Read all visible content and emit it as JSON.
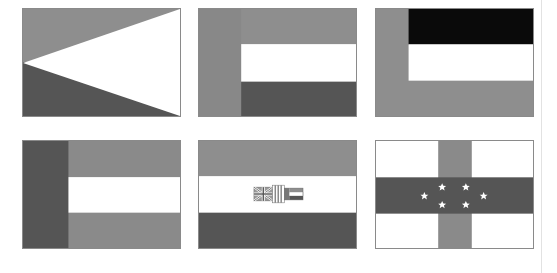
{
  "colors": {
    "light_gray": "#8e8e8e",
    "mid_gray": "#7f7f7f",
    "dark_gray": "#555555",
    "black": "#0a0a0a",
    "white": "#ffffff",
    "border": "#8a8a8a"
  },
  "flags": [
    {
      "id": "flag-1",
      "description": "Horizontal bicolor with white triangle from fly",
      "x": 22,
      "y": 8
    },
    {
      "id": "flag-2",
      "description": "Vertical hoist band with three horizontal stripes",
      "x": 198,
      "y": 8
    },
    {
      "id": "flag-3",
      "description": "L-shaped frame with black and white stripes",
      "x": 375,
      "y": 8
    },
    {
      "id": "flag-4",
      "description": "Dark hoist band with gray-white-gray stripes",
      "x": 22,
      "y": 140
    },
    {
      "id": "flag-5",
      "description": "Tricolor with central emblem of three small flags",
      "x": 198,
      "y": 140
    },
    {
      "id": "flag-6",
      "description": "White field with vertical gray band, horizontal dark band, six white stars",
      "x": 375,
      "y": 140
    }
  ],
  "stars_count": 6
}
